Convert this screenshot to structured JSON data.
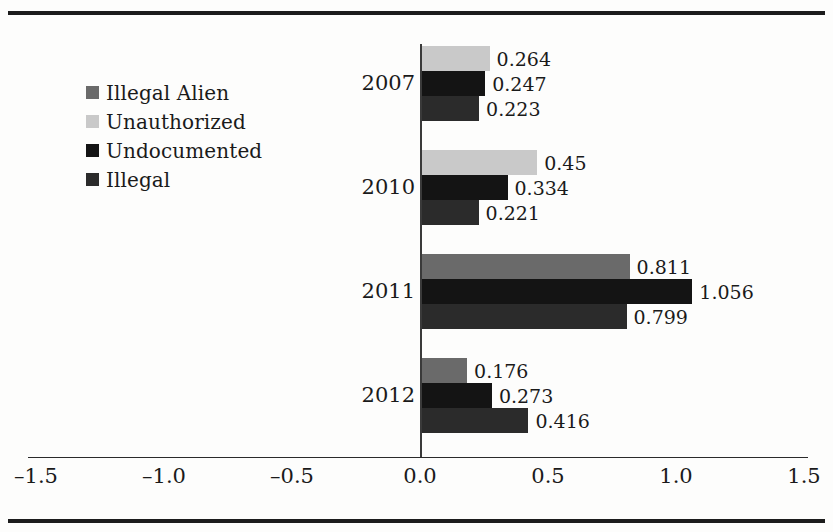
{
  "figure": {
    "background": "#fdfdfc",
    "rule_color": "#1c1c1c"
  },
  "legend": {
    "position": "left-upper",
    "items": [
      {
        "label": "Illegal Alien",
        "color": "#6a6a6a"
      },
      {
        "label": "Unauthorized",
        "color": "#c9c9c9"
      },
      {
        "label": "Undocumented",
        "color": "#141414"
      },
      {
        "label": "Illegal",
        "color": "#2b2b2b"
      }
    ]
  },
  "chart_data": {
    "type": "bar",
    "orientation": "horizontal",
    "title": "",
    "xlabel": "",
    "ylabel": "",
    "xlim": [
      -1.5,
      1.5
    ],
    "xticks": [
      -1.5,
      -1.0,
      -0.5,
      0.0,
      0.5,
      1.0,
      1.5
    ],
    "xtick_labels": [
      "–1.5",
      "–1.0",
      "–0.5",
      "0.0",
      "0.5",
      "1.0",
      "1.5"
    ],
    "grid": false,
    "legend_position": "left-upper",
    "categories": [
      "2007",
      "2010",
      "2011",
      "2012"
    ],
    "series": [
      {
        "name": "Illegal Alien",
        "color": "#6a6a6a",
        "values": [
          null,
          null,
          0.811,
          0.176
        ]
      },
      {
        "name": "Unauthorized",
        "color": "#c9c9c9",
        "values": [
          0.264,
          0.45,
          null,
          null
        ]
      },
      {
        "name": "Undocumented",
        "color": "#141414",
        "values": [
          0.247,
          0.334,
          1.056,
          0.273
        ]
      },
      {
        "name": "Illegal",
        "color": "#2b2b2b",
        "values": [
          0.223,
          0.221,
          0.799,
          0.416
        ]
      }
    ],
    "groups": [
      {
        "category": "2007",
        "bars": [
          {
            "series": "Unauthorized",
            "value": 0.264,
            "label": "0.264",
            "color": "#c9c9c9"
          },
          {
            "series": "Undocumented",
            "value": 0.247,
            "label": "0.247",
            "color": "#141414"
          },
          {
            "series": "Illegal",
            "value": 0.223,
            "label": "0.223",
            "color": "#2b2b2b"
          }
        ]
      },
      {
        "category": "2010",
        "bars": [
          {
            "series": "Unauthorized",
            "value": 0.45,
            "label": "0.45",
            "color": "#c9c9c9"
          },
          {
            "series": "Undocumented",
            "value": 0.334,
            "label": "0.334",
            "color": "#141414"
          },
          {
            "series": "Illegal",
            "value": 0.221,
            "label": "0.221",
            "color": "#2b2b2b"
          }
        ]
      },
      {
        "category": "2011",
        "bars": [
          {
            "series": "Illegal Alien",
            "value": 0.811,
            "label": "0.811",
            "color": "#6a6a6a"
          },
          {
            "series": "Undocumented",
            "value": 1.056,
            "label": "1.056",
            "color": "#141414"
          },
          {
            "series": "Illegal",
            "value": 0.799,
            "label": "0.799",
            "color": "#2b2b2b"
          }
        ]
      },
      {
        "category": "2012",
        "bars": [
          {
            "series": "Illegal Alien",
            "value": 0.176,
            "label": "0.176",
            "color": "#6a6a6a"
          },
          {
            "series": "Undocumented",
            "value": 0.273,
            "label": "0.273",
            "color": "#141414"
          },
          {
            "series": "Illegal",
            "value": 0.416,
            "label": "0.416",
            "color": "#2b2b2b"
          }
        ]
      }
    ]
  },
  "layout": {
    "zero_x_px": 420,
    "px_per_unit": 256,
    "plot_top_px": 46,
    "group_height_px": 104,
    "bar_height_px": 25,
    "bar_gap_px": 0
  }
}
